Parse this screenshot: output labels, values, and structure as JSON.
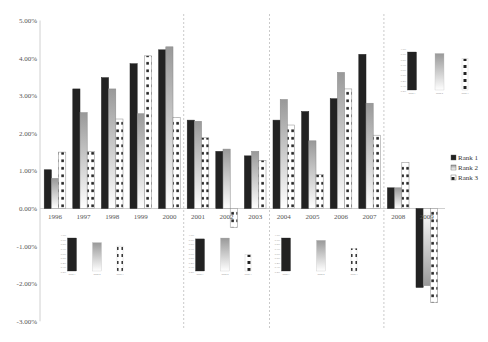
{
  "chart_data": {
    "type": "bar",
    "title": "",
    "xlabel": "",
    "ylabel": "",
    "ylim": [
      -0.03,
      0.05
    ],
    "y_ticks": [
      "5.00%",
      "4.00%",
      "3.00%",
      "2.00%",
      "1.00%",
      "0.00%",
      "-1.00%",
      "-2.00%",
      "-3.00%"
    ],
    "grid": false,
    "legend_position": "right",
    "categories": [
      "1996",
      "1997",
      "1998",
      "1999",
      "2000",
      "2001",
      "2002",
      "2003",
      "2004",
      "2005",
      "2006",
      "2007",
      "2008",
      "2009"
    ],
    "series": [
      {
        "name": "Rank 1",
        "values": [
          1.03,
          3.18,
          3.48,
          3.85,
          4.22,
          2.35,
          1.52,
          1.4,
          2.35,
          2.58,
          2.92,
          4.1,
          0.55,
          -2.1
        ]
      },
      {
        "name": "Rank 2",
        "values": [
          0.8,
          2.55,
          3.18,
          2.52,
          4.3,
          2.32,
          1.58,
          1.52,
          2.9,
          1.8,
          3.62,
          2.8,
          0.55,
          -2.05
        ]
      },
      {
        "name": "Rank 3",
        "values": [
          1.5,
          1.52,
          2.38,
          4.06,
          2.42,
          1.88,
          -0.5,
          1.28,
          2.22,
          0.9,
          3.18,
          1.95,
          1.22,
          -2.5
        ]
      }
    ],
    "value_unit": "%",
    "period_separators_after": [
      "2000",
      "2003",
      "2007"
    ],
    "annotations": "Inset mini bar charts per period comparing Rank 1, Rank 2, Rank 3 averages",
    "insets": [
      {
        "period": "1996-2000",
        "labels": [
          "Rank 1",
          "Rank 2",
          "Rank 3"
        ],
        "values": [
          3.15,
          2.71,
          2.38
        ]
      },
      {
        "period": "2001-2003",
        "labels": [
          "Rank 1",
          "Rank 2",
          "Rank 3"
        ],
        "values": [
          1.76,
          1.81,
          0.89
        ]
      },
      {
        "period": "2004-2007",
        "labels": [
          "Rank 1",
          "Rank 2",
          "Rank 3"
        ],
        "values": [
          2.99,
          2.78,
          2.06
        ]
      },
      {
        "period": "2008-2009",
        "labels": [
          "Rank 1",
          "Rank 2",
          "Rank 3"
        ],
        "values": [
          -0.78,
          -0.75,
          -0.64
        ]
      }
    ]
  },
  "legend": {
    "items": [
      {
        "label": "Rank 1",
        "color": "#222222"
      },
      {
        "label": "Rank 2",
        "color": "#b0b0b0"
      },
      {
        "label": "Rank 3",
        "color": "#ffffff"
      }
    ]
  },
  "colors": {
    "rank1": "#222222",
    "rank2_top": "#9a9a9a",
    "rank2_bottom": "#ffffff",
    "rank3_fill": "#ffffff",
    "rank3_dot": "#222222",
    "axis": "#cccccc",
    "separator": "#bbbbbb"
  }
}
